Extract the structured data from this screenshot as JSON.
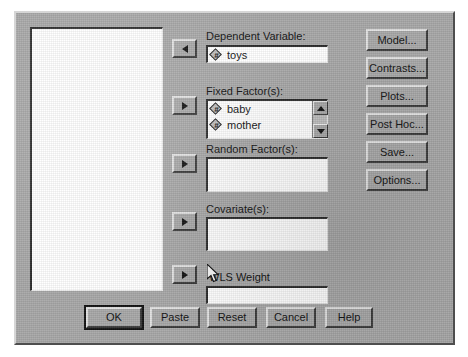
{
  "dialog": {
    "title": "Univariate",
    "background_color": "#a8a8a8",
    "field_background_color": "#ffffff",
    "text_color": "#111111"
  },
  "source_list": {
    "name": "source-variable-list",
    "items": []
  },
  "transfer_buttons": [
    {
      "name": "move-dependent-variable",
      "direction": "left",
      "glyph": "triangle-left-icon"
    },
    {
      "name": "move-fixed-factors",
      "direction": "right",
      "glyph": "triangle-right-icon"
    },
    {
      "name": "move-random-factors",
      "direction": "right",
      "glyph": "triangle-right-icon"
    },
    {
      "name": "move-covariates",
      "direction": "right",
      "glyph": "triangle-right-icon"
    },
    {
      "name": "move-wls-weight",
      "direction": "right",
      "glyph": "triangle-right-icon"
    }
  ],
  "fields": {
    "dependent_variable": {
      "label": "Dependent Variable:",
      "items": [
        {
          "icon": "scale-variable-icon",
          "glyph": "#",
          "name": "toys"
        }
      ]
    },
    "fixed_factors": {
      "label": "Fixed Factor(s):",
      "items": [
        {
          "icon": "scale-variable-icon",
          "glyph": "#",
          "name": "baby"
        },
        {
          "icon": "scale-variable-icon",
          "glyph": "#",
          "name": "mother"
        }
      ],
      "has_scrollbar": true
    },
    "random_factors": {
      "label": "Random Factor(s):",
      "items": []
    },
    "covariates": {
      "label": "Covariate(s):",
      "items": []
    },
    "wls_weight": {
      "label": "WLS Weight",
      "value": ""
    }
  },
  "side_buttons": [
    {
      "name": "model-button",
      "label": "Model..."
    },
    {
      "name": "contrasts-button",
      "label": "Contrasts..."
    },
    {
      "name": "plots-button",
      "label": "Plots..."
    },
    {
      "name": "post-hoc-button",
      "label": "Post Hoc..."
    },
    {
      "name": "save-button",
      "label": "Save..."
    },
    {
      "name": "options-button",
      "label": "Options..."
    }
  ],
  "bottom_buttons": [
    {
      "name": "ok-button",
      "label": "OK",
      "focused": true
    },
    {
      "name": "paste-button",
      "label": "Paste",
      "focused": false
    },
    {
      "name": "reset-button",
      "label": "Reset",
      "focused": false
    },
    {
      "name": "cancel-button",
      "label": "Cancel",
      "focused": false
    },
    {
      "name": "help-button",
      "label": "Help",
      "focused": false
    }
  ],
  "cursor": {
    "name": "mouse-pointer",
    "x": 205,
    "y": 262
  }
}
